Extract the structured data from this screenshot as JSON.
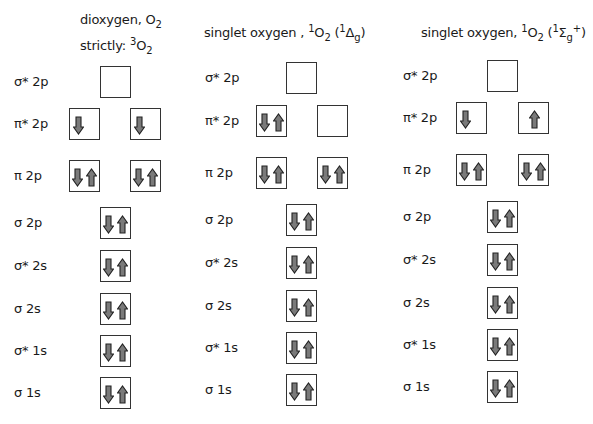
{
  "colors": {
    "arrow_fill": "#7a7a7a",
    "arrow_stroke": "#222222",
    "box_border": "#333333"
  },
  "columns": [
    {
      "title_line1": "dioxygen, O",
      "title_line1_sub": "2",
      "title_line2": "strictly: ",
      "title_line2_sup": "3",
      "title_line2_main": "O",
      "title_line2_sub": "2",
      "levels": [
        {
          "label": "σ* 2p",
          "orbitals": [
            "empty"
          ]
        },
        {
          "label": "π* 2p",
          "orbitals": [
            "down",
            "down"
          ]
        },
        {
          "label": "π 2p",
          "orbitals": [
            "pair",
            "pair"
          ]
        },
        {
          "label": "σ 2p",
          "orbitals": [
            "pair"
          ]
        },
        {
          "label": "σ* 2s",
          "orbitals": [
            "pair"
          ]
        },
        {
          "label": "σ 2s",
          "orbitals": [
            "pair"
          ]
        },
        {
          "label": "σ* 1s",
          "orbitals": [
            "pair"
          ]
        },
        {
          "label": "σ 1s",
          "orbitals": [
            "pair"
          ]
        }
      ]
    },
    {
      "title_prefix": "singlet oxygen , ",
      "title_sup1": "1",
      "title_main": "O",
      "title_sub1": "2",
      "title_paren_open": " (",
      "title_sup2": "1",
      "title_term": "Δ",
      "title_term_sub": "g",
      "title_term_sup": "",
      "title_paren_close": ")",
      "levels": [
        {
          "label": "σ* 2p",
          "orbitals": [
            "empty"
          ]
        },
        {
          "label": "π* 2p",
          "orbitals": [
            "pair",
            "empty"
          ]
        },
        {
          "label": "π 2p",
          "orbitals": [
            "pair",
            "pair"
          ]
        },
        {
          "label": "σ 2p",
          "orbitals": [
            "pair"
          ]
        },
        {
          "label": "σ* 2s",
          "orbitals": [
            "pair"
          ]
        },
        {
          "label": "σ 2s",
          "orbitals": [
            "pair"
          ]
        },
        {
          "label": "σ* 1s",
          "orbitals": [
            "pair"
          ]
        },
        {
          "label": "σ 1s",
          "orbitals": [
            "pair"
          ]
        }
      ]
    },
    {
      "title_prefix": "singlet oxygen, ",
      "title_sup1": "1",
      "title_main": "O",
      "title_sub1": "2",
      "title_paren_open": " (",
      "title_sup2": "1",
      "title_term": "Σ",
      "title_term_sub": "g",
      "title_term_sup": "+",
      "title_paren_close": ")",
      "levels": [
        {
          "label": "σ* 2p",
          "orbitals": [
            "empty"
          ]
        },
        {
          "label": "π* 2p",
          "orbitals": [
            "down",
            "up"
          ]
        },
        {
          "label": "π 2p",
          "orbitals": [
            "pair",
            "pair"
          ]
        },
        {
          "label": "σ 2p",
          "orbitals": [
            "pair"
          ]
        },
        {
          "label": "σ* 2s",
          "orbitals": [
            "pair"
          ]
        },
        {
          "label": "σ 2s",
          "orbitals": [
            "pair"
          ]
        },
        {
          "label": "σ* 1s",
          "orbitals": [
            "pair"
          ]
        },
        {
          "label": "σ 1s",
          "orbitals": [
            "pair"
          ]
        }
      ]
    }
  ]
}
